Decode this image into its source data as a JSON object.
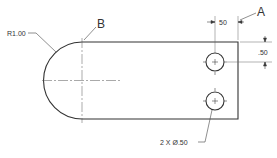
{
  "drawing": {
    "labels": {
      "radius": "R1.00",
      "point_b": "B",
      "point_a": "A",
      "dim_horizontal": ".50",
      "dim_horizontal_display": "50",
      "dim_vertical": ".50",
      "hole_callout": "2 X Ø.50"
    },
    "colors": {
      "line": "#333333",
      "background": "#ffffff"
    }
  }
}
